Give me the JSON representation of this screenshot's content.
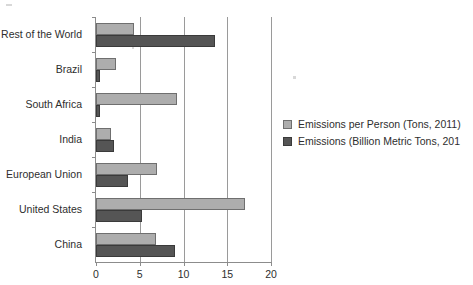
{
  "chart_data": {
    "type": "bar",
    "orientation": "horizontal",
    "title": "",
    "xlabel": "",
    "ylabel": "",
    "xlim": [
      0,
      20
    ],
    "xticks": [
      0,
      5,
      10,
      15,
      20
    ],
    "xtick_labels": [
      "0",
      "5",
      "10",
      "15",
      "20"
    ],
    "grid": true,
    "legend_position": "right",
    "categories": [
      "Rest of the World",
      "Brazil",
      "South Africa",
      "India",
      "European Union",
      "United States",
      "China"
    ],
    "series": [
      {
        "name": "Emissions per Person (Tons, 2011)",
        "color": "#adadad",
        "values": [
          4.3,
          2.3,
          9.2,
          1.7,
          7.0,
          17.0,
          6.8
        ]
      },
      {
        "name": "Emissions (Billion Metric Tons, 201",
        "color": "#555555",
        "values": [
          13.6,
          0.5,
          0.5,
          2.1,
          3.6,
          5.3,
          9.0
        ]
      }
    ]
  },
  "legend": {
    "items": [
      {
        "label": "Emissions per Person (Tons, 2011)"
      },
      {
        "label": "Emissions (Billion Metric Tons, 201"
      }
    ]
  }
}
